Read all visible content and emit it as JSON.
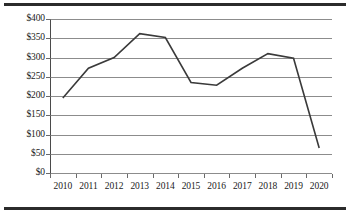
{
  "chart_data": {
    "type": "line",
    "title": "",
    "subtitle": "",
    "xlabel": "",
    "ylabel": "",
    "categories": [
      "2010",
      "2011",
      "2012",
      "2013",
      "2014",
      "2015",
      "2016",
      "2017",
      "2018",
      "2019",
      "2020"
    ],
    "values": [
      195,
      272,
      300,
      362,
      352,
      235,
      228,
      272,
      310,
      298,
      65
    ],
    "series": [
      {
        "name": "",
        "values": [
          195,
          272,
          300,
          362,
          352,
          235,
          228,
          272,
          310,
          298,
          65
        ]
      }
    ],
    "ylim": [
      0,
      400
    ],
    "ytick_values": [
      0,
      50,
      100,
      150,
      200,
      250,
      300,
      350,
      400
    ],
    "ytick_labels": [
      "$0",
      "$50",
      "$100",
      "$150",
      "$200",
      "$250",
      "$300",
      "$350",
      "$400"
    ],
    "xtick_labels": [
      "2010",
      "2011",
      "2012",
      "2013",
      "2014",
      "2015",
      "2016",
      "2017",
      "2018",
      "2019",
      "2020"
    ],
    "grid": true,
    "grid_axis": "y",
    "legend": false,
    "legend_position": "none",
    "markers": false,
    "annotations": []
  },
  "style": {
    "line_color": "#3a3a3a",
    "grid_color": "#8c8c8c",
    "axis_color": "#4a4a4a",
    "text_color": "#1a1a1a",
    "frame_color": "#2b2b2b",
    "background": "#ffffff"
  }
}
